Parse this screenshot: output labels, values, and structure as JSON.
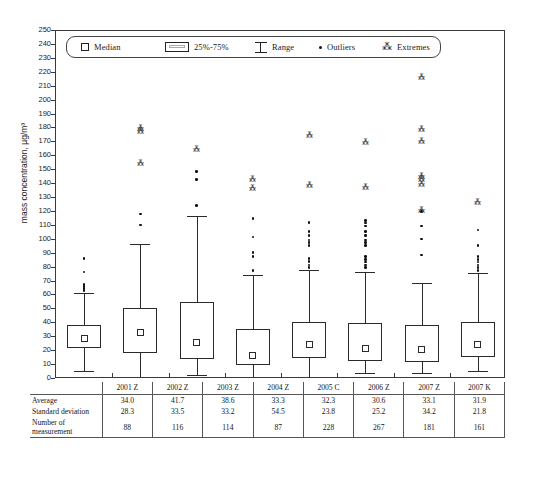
{
  "chart_data": {
    "type": "box",
    "title": "",
    "xlabel": "",
    "ylabel": "mass concentration, µg/m³",
    "ylim": [
      0,
      250
    ],
    "ytick_step": 10,
    "grid": false,
    "legend_position": "top-inside",
    "legend": [
      {
        "key": "median",
        "label": "Median"
      },
      {
        "key": "iqr",
        "label": "25%-75%"
      },
      {
        "key": "range",
        "label": "Range"
      },
      {
        "key": "outliers",
        "label": "Outliers"
      },
      {
        "key": "extremes",
        "label": "Extremes"
      }
    ],
    "categories": [
      "2001 Z",
      "2002 Z",
      "2003 Z",
      "2004 Z",
      "2005 C",
      "2006 Z",
      "2007 Z",
      "2007 K"
    ],
    "boxes": [
      {
        "category": "2001 Z",
        "whisker_low": 6,
        "q1": 22,
        "median": 29,
        "q3": 38.5,
        "whisker_high": 62,
        "outliers": [
          63.5,
          65,
          66.5,
          68,
          77,
          86.5
        ],
        "extremes": []
      },
      {
        "category": "2002 Z",
        "whisker_low": 1,
        "q1": 19,
        "median": 33.5,
        "q3": 51,
        "whisker_high": 97,
        "outliers": [
          110.5,
          118.5
        ],
        "extremes": [
          155.5,
          178,
          180.5
        ]
      },
      {
        "category": "2003 Z",
        "whisker_low": 3,
        "q1": 14.5,
        "median": 26.5,
        "q3": 55.5,
        "whisker_high": 117,
        "outliers": [
          124.5,
          143.5,
          149
        ],
        "extremes": [
          165.5
        ]
      },
      {
        "category": "2004 Z",
        "whisker_low": 1,
        "q1": 10,
        "median": 17,
        "q3": 36,
        "whisker_high": 75,
        "outliers": [
          78,
          88,
          91,
          102,
          115.5
        ],
        "extremes": [
          137.5,
          144
        ]
      },
      {
        "category": "2005 C",
        "whisker_low": 0.5,
        "q1": 15,
        "median": 25,
        "q3": 41,
        "whisker_high": 78,
        "outliers": [
          80,
          82,
          84.5,
          86.5,
          96,
          98,
          100,
          103,
          106,
          112.5
        ],
        "extremes": [
          139.5,
          175
        ]
      },
      {
        "category": "2006 Z",
        "whisker_low": 4,
        "q1": 13,
        "median": 22,
        "q3": 40,
        "whisker_high": 77,
        "outliers": [
          80,
          82,
          84,
          86,
          88,
          96,
          98,
          100,
          103,
          106,
          110,
          112,
          114
        ],
        "extremes": [
          138,
          170.5
        ]
      },
      {
        "category": "2007 Z",
        "whisker_low": 4,
        "q1": 12,
        "median": 21.5,
        "q3": 39,
        "whisker_high": 69,
        "outliers": [
          89,
          100.5,
          110,
          120.5
        ],
        "extremes": [
          121.5,
          140,
          143.5,
          146,
          171,
          179.5,
          217
        ]
      },
      {
        "category": "2007 K",
        "whisker_low": 5.5,
        "q1": 16,
        "median": 24.5,
        "q3": 41,
        "whisker_high": 76,
        "outliers": [
          78,
          80,
          82,
          84,
          86,
          88,
          96,
          107
        ],
        "extremes": [
          127
        ]
      }
    ]
  },
  "stats_table": {
    "corner_label": "",
    "column_headers": [
      "2001 Z",
      "2002 Z",
      "2003 Z",
      "2004 Z",
      "2005 C",
      "2006 Z",
      "2007 Z",
      "2007 K"
    ],
    "rows": [
      {
        "label": "Average",
        "values": [
          "34.0",
          "41.7",
          "38.6",
          "33.3",
          "32.3",
          "30.6",
          "33.1",
          "31.9"
        ]
      },
      {
        "label": "Standard deviation",
        "values": [
          "28.3",
          "33.5",
          "33.2",
          "54.5",
          "23.8",
          "25.2",
          "34.2",
          "21.8"
        ]
      },
      {
        "label": "Number of measurement",
        "values": [
          "88",
          "116",
          "114",
          "87",
          "228",
          "267",
          "181",
          "161"
        ]
      }
    ]
  },
  "colors": {
    "axis": "#3a3a3a",
    "box_stroke": "#2a2a2a",
    "outlier": "#111111",
    "extreme": "#333333",
    "background": "#ffffff"
  }
}
